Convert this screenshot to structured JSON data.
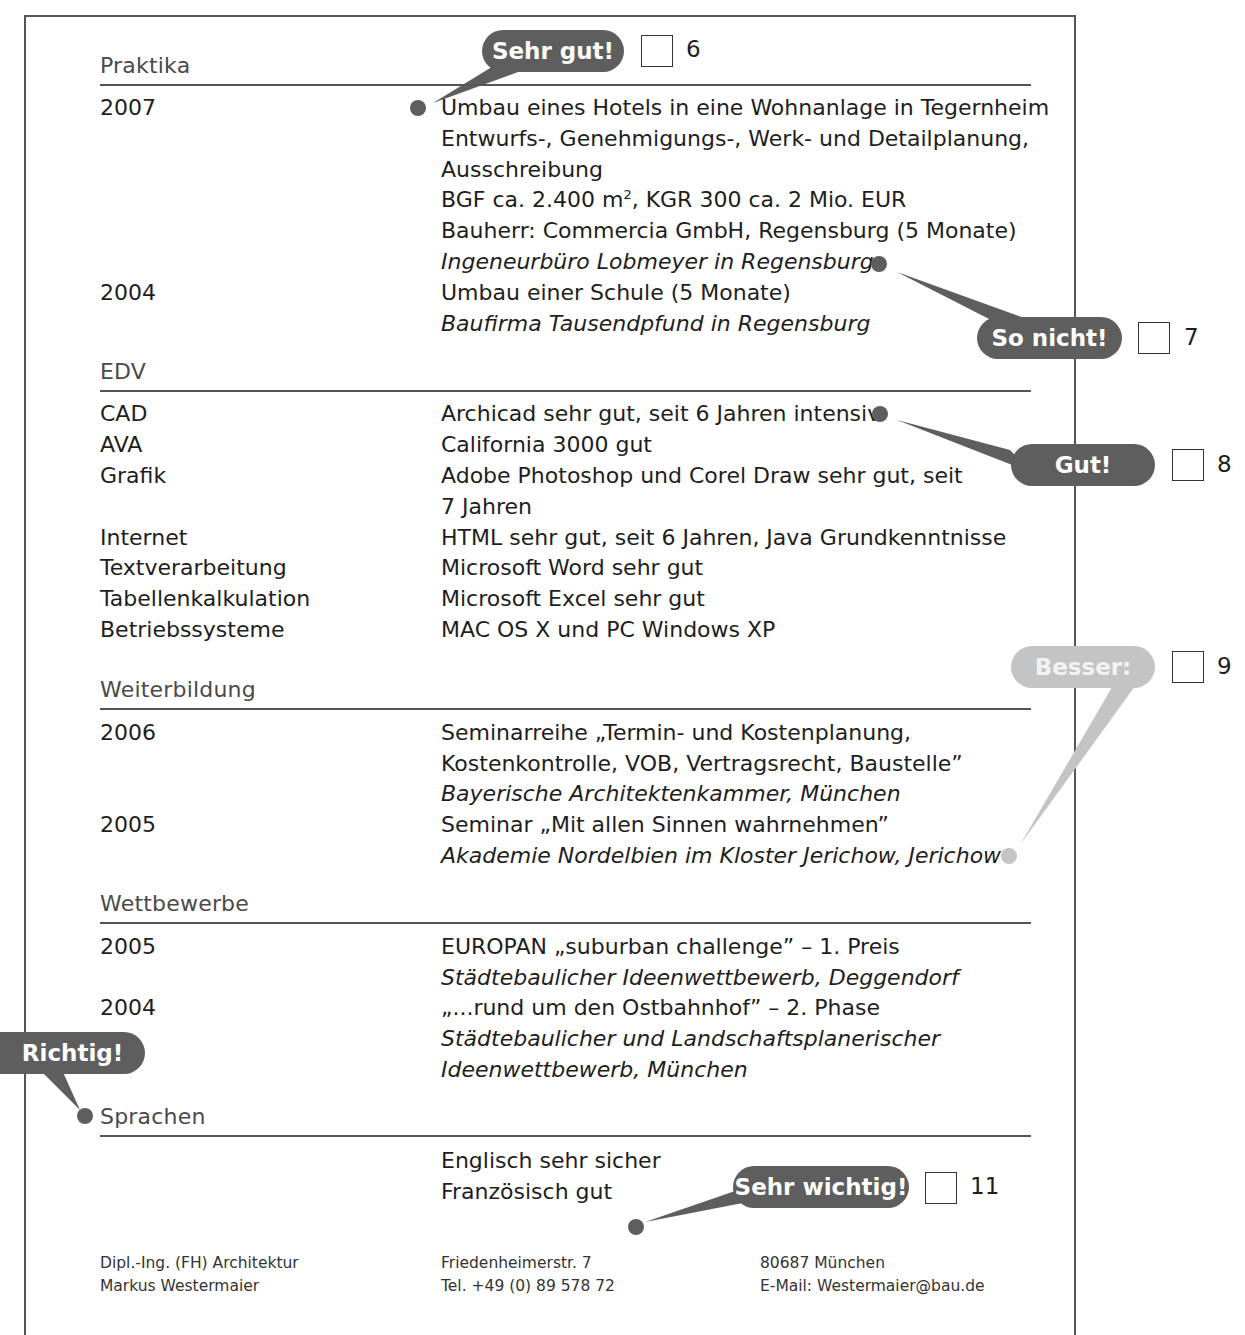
{
  "sections": {
    "praktika": {
      "title": "Praktika",
      "entries": [
        {
          "year": "2007",
          "lines": [
            "Umbau eines Hotels in eine Wohnanlage in Tegernheim",
            "Entwurfs-, Genehmigungs-, Werk- und Detailplanung,",
            "Ausschreibung",
            "BGF ca. 2.400 m",
            ", KGR 300 ca. 2 Mio. EUR",
            "Bauherr: Commercia GmbH, Regensburg (5 Monate)",
            "Ingeneurbüro Lobmeyer in Regensburg"
          ],
          "superscript": "2"
        },
        {
          "year": "2004",
          "lines": [
            "Umbau einer Schule (5 Monate)",
            "Baufirma Tausendpfund in Regensburg"
          ]
        }
      ]
    },
    "edv": {
      "title": "EDV",
      "rows": [
        {
          "label": "CAD",
          "value": "Archicad sehr gut, seit 6 Jahren intensiv"
        },
        {
          "label": "AVA",
          "value": "California 3000 gut"
        },
        {
          "label": "Grafik",
          "value": "Adobe Photoshop und Corel Draw sehr gut, seit",
          "value2": "7 Jahren"
        },
        {
          "label": "Internet",
          "value": "HTML sehr gut, seit 6 Jahren, Java Grundkenntnisse"
        },
        {
          "label": "Textverarbeitung",
          "value": "Microsoft Word sehr gut"
        },
        {
          "label": "Tabellenkalkulation",
          "value": "Microsoft Excel sehr gut"
        },
        {
          "label": "Betriebssysteme",
          "value": "MAC OS X und PC Windows XP"
        }
      ]
    },
    "weiterbildung": {
      "title": "Weiterbildung",
      "entries": [
        {
          "year": "2006",
          "lines": [
            "Seminarreihe „Termin- und Kostenplanung,",
            "Kostenkontrolle, VOB, Vertragsrecht, Baustelle”",
            "Bayerische Architektenkammer, München"
          ]
        },
        {
          "year": "2005",
          "lines": [
            "Seminar „Mit allen Sinnen wahrnehmen”",
            "Akademie Nordelbien im Kloster Jerichow, Jerichow"
          ]
        }
      ]
    },
    "wettbewerbe": {
      "title": "Wettbewerbe",
      "entries": [
        {
          "year": "2005",
          "lines": [
            "EUROPAN „suburban challenge” – 1. Preis",
            "Städtebaulicher Ideenwettbewerb, Deggendorf"
          ]
        },
        {
          "year": "2004",
          "lines": [
            "„...rund um den Ostbahnhof” – 2. Phase",
            "Städtebaulicher und Landschaftsplanerischer",
            "Ideenwettbewerb, München"
          ]
        }
      ]
    },
    "sprachen": {
      "title": "Sprachen",
      "lines": [
        "Englisch sehr sicher",
        "Französisch gut"
      ]
    }
  },
  "annotations": [
    {
      "label": "Sehr gut!",
      "number": "6",
      "style": "dark"
    },
    {
      "label": "So nicht!",
      "number": "7",
      "style": "dark"
    },
    {
      "label": "Gut!",
      "number": "8",
      "style": "dark"
    },
    {
      "label": "Besser:",
      "number": "9",
      "style": "light"
    },
    {
      "label": "Richtig!",
      "number": "",
      "style": "dark"
    },
    {
      "label": "Sehr wichtig!",
      "number": "11",
      "style": "dark"
    }
  ],
  "footer": {
    "col1": [
      "Dipl.-Ing. (FH) Architektur",
      "Markus Westermaier"
    ],
    "col2": [
      "Friedenheimerstr. 7",
      "Tel. +49 (0) 89 578 72"
    ],
    "col3": [
      "80687 München",
      "E-Mail: Westermaier@bau.de"
    ]
  },
  "colors": {
    "bubble_dark": "#5e5e5e",
    "bubble_light": "#c4c4c4",
    "rule": "#555555",
    "text": "#1e1e1e"
  }
}
